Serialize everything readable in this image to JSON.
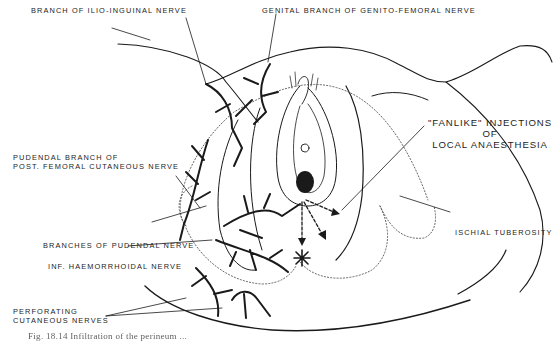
{
  "figure": {
    "type": "anatomical line illustration",
    "labels": {
      "ilio_inguinal": "BRANCH OF ILIO-INGUINAL NERVE",
      "genito_femoral": "GENITAL BRANCH OF GENITO-FEMORAL NERVE",
      "pudendal_branch_line1": "PUDENDAL BRANCH OF",
      "pudendal_branch_line2": "POST. FEMORAL CUTANEOUS NERVE",
      "fanlike_line1": "\"FANLIKE\" INJECTIONS",
      "fanlike_line2": "OF",
      "fanlike_line3": "LOCAL ANAESTHESIA",
      "ischial": "ISCHIAL TUBEROSITY",
      "pudendal_branches": "BRANCHES OF PUDENDAL NERVE",
      "haemorrhoidal": "INF. HAEMORRHOIDAL NERVE",
      "perforating_line1": "PERFORATING",
      "perforating_line2": "CUTANEOUS NERVES"
    },
    "caption": "Fig. 18.14 Infiltration of the perineum ..."
  }
}
